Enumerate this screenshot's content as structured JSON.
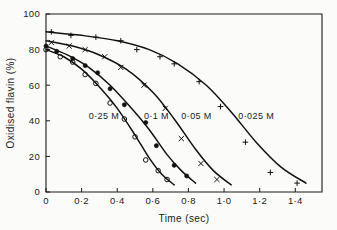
{
  "chart_data": {
    "type": "line",
    "title": "",
    "subtitle": "",
    "xlabel": "Time  (sec)",
    "ylabel": "Oxidised  flavin  (%)",
    "xlim": [
      0,
      1.55
    ],
    "ylim": [
      0,
      100
    ],
    "grid": false,
    "legend_position": "inline-annotations",
    "x_ticks": [
      "0",
      "0·2",
      "0·4",
      "0·6",
      "0·8",
      "1·0",
      "1·2",
      "1·4"
    ],
    "x_tick_values": [
      0,
      0.2,
      0.4,
      0.6,
      0.8,
      1.0,
      1.2,
      1.4
    ],
    "y_ticks": [
      "0",
      "20",
      "40",
      "60",
      "80",
      "100"
    ],
    "y_tick_values": [
      0,
      20,
      40,
      60,
      80,
      100
    ],
    "series": [
      {
        "name": "0·25 M",
        "marker": "open-circle",
        "label_text": "0·25 M",
        "label_x": 0.24,
        "label_y": 41,
        "points": [
          {
            "x": 0.0,
            "y": 80
          },
          {
            "x": 0.08,
            "y": 76
          },
          {
            "x": 0.15,
            "y": 73
          },
          {
            "x": 0.22,
            "y": 66
          },
          {
            "x": 0.28,
            "y": 61
          },
          {
            "x": 0.36,
            "y": 50
          },
          {
            "x": 0.44,
            "y": 41
          },
          {
            "x": 0.5,
            "y": 31
          },
          {
            "x": 0.56,
            "y": 18
          },
          {
            "x": 0.63,
            "y": 12
          },
          {
            "x": 0.68,
            "y": 7
          }
        ],
        "curve": [
          {
            "x": 0.0,
            "y": 80
          },
          {
            "x": 0.1,
            "y": 76
          },
          {
            "x": 0.2,
            "y": 69
          },
          {
            "x": 0.3,
            "y": 59
          },
          {
            "x": 0.4,
            "y": 47
          },
          {
            "x": 0.5,
            "y": 32
          },
          {
            "x": 0.58,
            "y": 19
          },
          {
            "x": 0.65,
            "y": 10
          },
          {
            "x": 0.72,
            "y": 4
          }
        ]
      },
      {
        "name": "0·1 M",
        "marker": "filled-circle",
        "label_text": "0·1 M",
        "label_x": 0.55,
        "label_y": 41,
        "points": [
          {
            "x": 0.0,
            "y": 82
          },
          {
            "x": 0.06,
            "y": 79
          },
          {
            "x": 0.15,
            "y": 75
          },
          {
            "x": 0.22,
            "y": 71
          },
          {
            "x": 0.29,
            "y": 67
          },
          {
            "x": 0.36,
            "y": 58
          },
          {
            "x": 0.44,
            "y": 49
          },
          {
            "x": 0.56,
            "y": 39
          },
          {
            "x": 0.62,
            "y": 26
          },
          {
            "x": 0.72,
            "y": 15
          },
          {
            "x": 0.79,
            "y": 9
          }
        ],
        "curve": [
          {
            "x": 0.0,
            "y": 82
          },
          {
            "x": 0.12,
            "y": 77
          },
          {
            "x": 0.24,
            "y": 70
          },
          {
            "x": 0.36,
            "y": 60
          },
          {
            "x": 0.48,
            "y": 47
          },
          {
            "x": 0.58,
            "y": 35
          },
          {
            "x": 0.68,
            "y": 21
          },
          {
            "x": 0.76,
            "y": 12
          },
          {
            "x": 0.84,
            "y": 5
          }
        ]
      },
      {
        "name": "0·05 M",
        "marker": "cross",
        "label_text": "0·05 M",
        "label_x": 0.76,
        "label_y": 41,
        "points": [
          {
            "x": 0.03,
            "y": 84
          },
          {
            "x": 0.13,
            "y": 82
          },
          {
            "x": 0.22,
            "y": 80
          },
          {
            "x": 0.33,
            "y": 76
          },
          {
            "x": 0.42,
            "y": 70
          },
          {
            "x": 0.55,
            "y": 60
          },
          {
            "x": 0.67,
            "y": 47
          },
          {
            "x": 0.76,
            "y": 30
          },
          {
            "x": 0.87,
            "y": 16
          },
          {
            "x": 0.96,
            "y": 7
          }
        ],
        "curve": [
          {
            "x": 0.0,
            "y": 85
          },
          {
            "x": 0.15,
            "y": 82
          },
          {
            "x": 0.3,
            "y": 77
          },
          {
            "x": 0.45,
            "y": 69
          },
          {
            "x": 0.6,
            "y": 56
          },
          {
            "x": 0.72,
            "y": 41
          },
          {
            "x": 0.84,
            "y": 24
          },
          {
            "x": 0.94,
            "y": 12
          },
          {
            "x": 1.04,
            "y": 4
          }
        ]
      },
      {
        "name": "0·025 M",
        "marker": "plus",
        "label_text": "0·025 M",
        "label_x": 1.08,
        "label_y": 41,
        "points": [
          {
            "x": 0.03,
            "y": 90
          },
          {
            "x": 0.14,
            "y": 88
          },
          {
            "x": 0.28,
            "y": 87
          },
          {
            "x": 0.42,
            "y": 85
          },
          {
            "x": 0.51,
            "y": 80
          },
          {
            "x": 0.64,
            "y": 76
          },
          {
            "x": 0.72,
            "y": 72
          },
          {
            "x": 0.86,
            "y": 62
          },
          {
            "x": 0.98,
            "y": 48
          },
          {
            "x": 1.12,
            "y": 28
          },
          {
            "x": 1.26,
            "y": 11
          },
          {
            "x": 1.41,
            "y": 5
          }
        ],
        "curve": [
          {
            "x": 0.0,
            "y": 90
          },
          {
            "x": 0.2,
            "y": 88
          },
          {
            "x": 0.4,
            "y": 85
          },
          {
            "x": 0.58,
            "y": 80
          },
          {
            "x": 0.74,
            "y": 72
          },
          {
            "x": 0.9,
            "y": 60
          },
          {
            "x": 1.04,
            "y": 45
          },
          {
            "x": 1.18,
            "y": 28
          },
          {
            "x": 1.32,
            "y": 14
          },
          {
            "x": 1.46,
            "y": 5
          }
        ]
      }
    ]
  },
  "figure": {
    "background_color": "#fbfbf9",
    "ink_color": "#111111"
  }
}
